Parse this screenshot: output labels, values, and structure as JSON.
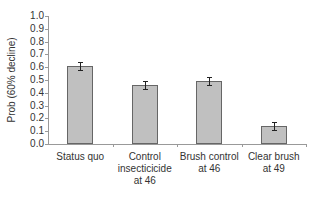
{
  "chart_data": {
    "type": "bar",
    "title": "",
    "xlabel": "",
    "ylabel": "Prob (60% decline)",
    "ylim": [
      0.0,
      1.0
    ],
    "yticks": [
      "0.0",
      "0.1",
      "0.2",
      "0.3",
      "0.4",
      "0.5",
      "0.6",
      "0.7",
      "0.8",
      "0.9",
      "1.0"
    ],
    "categories": [
      "Status quo",
      "Control insecticicide at 46",
      "Brush control at 46",
      "Clear brush at 49"
    ],
    "category_lines": [
      [
        "Status quo"
      ],
      [
        "Control",
        "insecticicide",
        "at 46"
      ],
      [
        "Brush control",
        "at 46"
      ],
      [
        "Clear brush",
        "at 49"
      ]
    ],
    "values": [
      0.61,
      0.46,
      0.49,
      0.14
    ],
    "error": [
      0.03,
      0.03,
      0.03,
      0.03
    ],
    "grid": false,
    "legend": null,
    "colors": {
      "bar_fill": "#c0c0c0",
      "bar_edge": "#666666",
      "axis": "#999999"
    }
  }
}
